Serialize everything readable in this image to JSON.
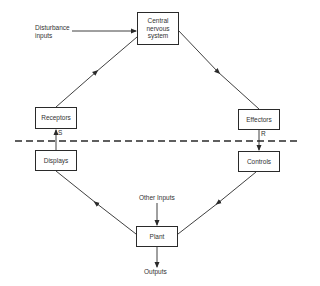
{
  "diagram": {
    "nodes": {
      "cns": "Central nervous system",
      "receptors": "Receptors",
      "effectors": "Effectors",
      "displays": "Displays",
      "controls": "Controls",
      "plant": "Plant"
    },
    "labels": {
      "disturbance_line1": "Disturbance",
      "disturbance_line2": "inputs",
      "other_inputs": "Other Inputs",
      "outputs": "Outputs",
      "s": "S",
      "r": "R"
    },
    "edges": [
      {
        "from": "disturbance_inputs",
        "to": "cns"
      },
      {
        "from": "receptors",
        "to": "cns"
      },
      {
        "from": "cns",
        "to": "effectors"
      },
      {
        "from": "effectors",
        "to": "controls",
        "label": "R"
      },
      {
        "from": "displays",
        "to": "receptors",
        "label": "S"
      },
      {
        "from": "controls",
        "to": "plant"
      },
      {
        "from": "plant",
        "to": "displays"
      },
      {
        "from": "other_inputs",
        "to": "plant"
      },
      {
        "from": "plant",
        "to": "outputs"
      }
    ],
    "colors": {
      "line": "#2a2a2a",
      "text": "#333333",
      "background": "#ffffff"
    }
  }
}
